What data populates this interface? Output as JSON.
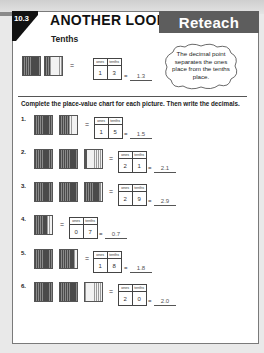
{
  "header": {
    "lesson_number": "10.3",
    "title": "ANOTHER LOOK",
    "banner": "Reteach",
    "subtitle": "Tenths"
  },
  "example": {
    "blocks": [
      "full",
      "partial-3"
    ],
    "chart_headers": [
      "ones",
      "tenths"
    ],
    "ones": "1",
    "tenths": "3",
    "answer": "1.3",
    "equals": "="
  },
  "callout": {
    "text": "The decimal point separates the ones place from the tenths place."
  },
  "instructions": "Complete the place-value chart for each picture. Then write the decimals.",
  "chart_headers": [
    "ones",
    "tenths"
  ],
  "equals": "=",
  "problems": [
    {
      "number": "1.",
      "blocks": [
        "full",
        "partial-5"
      ],
      "ones": "1",
      "tenths": "5",
      "answer": "1.5"
    },
    {
      "number": "2.",
      "blocks": [
        "full",
        "full",
        "partial-1"
      ],
      "ones": "2",
      "tenths": "1",
      "answer": "2.1"
    },
    {
      "number": "3.",
      "blocks": [
        "full",
        "full",
        "partial-9"
      ],
      "ones": "2",
      "tenths": "9",
      "answer": "2.9"
    },
    {
      "number": "4.",
      "blocks": [
        "partial-7"
      ],
      "ones": "0",
      "tenths": "7",
      "answer": "0.7"
    },
    {
      "number": "5.",
      "blocks": [
        "full",
        "partial-8"
      ],
      "ones": "1",
      "tenths": "8",
      "answer": "1.8"
    },
    {
      "number": "6.",
      "blocks": [
        "full",
        "full",
        "empty"
      ],
      "ones": "2",
      "tenths": "0",
      "answer": "2.0"
    }
  ]
}
